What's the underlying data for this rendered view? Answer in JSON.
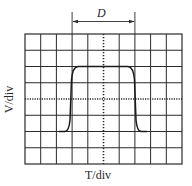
{
  "diagram": {
    "type": "oscilloscope-screen",
    "annotation": {
      "label": "D",
      "meaning": "pulse width"
    },
    "x_axis_label": "T/div",
    "y_axis_label": "V/div",
    "grid": {
      "columns": 10,
      "rows": 8
    },
    "waveform": {
      "shape": "rectangular pulse",
      "low_row_line": 6,
      "high_row_line": 2,
      "rise_col": 3,
      "fall_col": 7
    },
    "colors": {
      "grid": "#2a2a2a",
      "trace": "#1a1a1a",
      "background": "#ffffff"
    }
  }
}
